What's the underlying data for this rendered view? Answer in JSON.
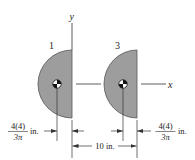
{
  "diagram": {
    "axes": {
      "x_label": "x",
      "y_label": "y"
    },
    "shapes": [
      {
        "id": "1",
        "label": "1",
        "type": "semicircle",
        "fill": "#9d9d9d",
        "outline": "#555555"
      },
      {
        "id": "3",
        "label": "3",
        "type": "semicircle",
        "fill": "#9d9d9d",
        "outline": "#555555"
      }
    ],
    "dimensions": {
      "left_offset": {
        "numerator": "4(4)",
        "denominator": "3π",
        "unit": "in."
      },
      "right_offset": {
        "numerator": "4(4)",
        "denominator": "3π",
        "unit": "in."
      },
      "spacing": {
        "text": "10 in."
      }
    },
    "colors": {
      "fill": "#9d9d9d",
      "outline": "#555555",
      "line": "#333333",
      "text": "#222222"
    }
  }
}
